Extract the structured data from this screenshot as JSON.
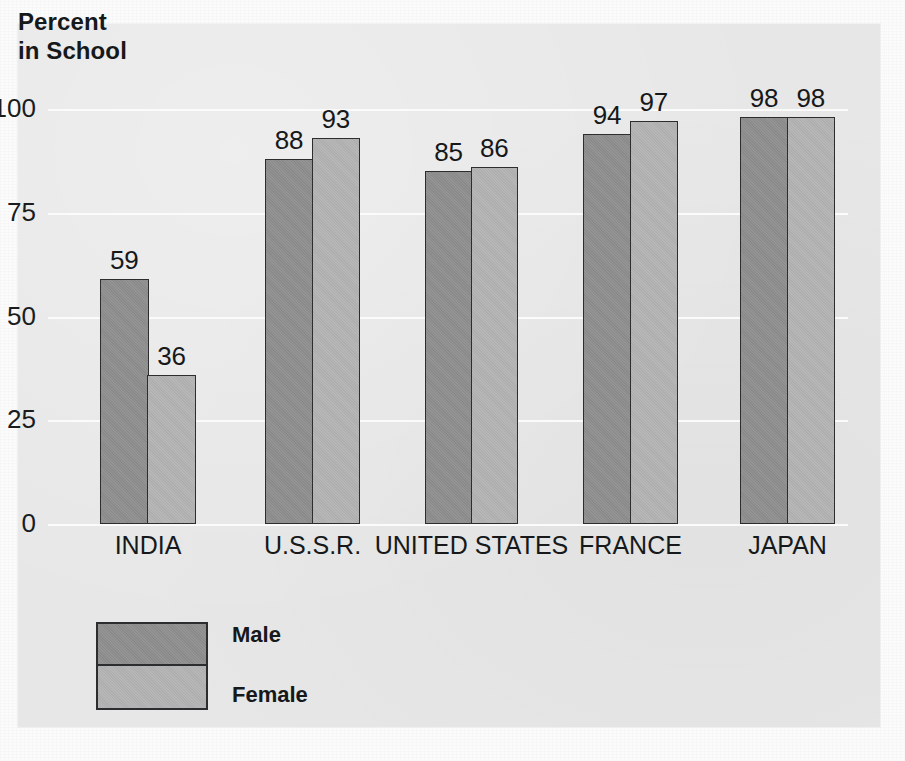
{
  "figure": {
    "title_line1": "Percent",
    "title_line2": "in School",
    "background_color": "#e6e7e6",
    "gridline_color": "#fafbfa"
  },
  "legend": {
    "position": "bottom-left",
    "entries": [
      {
        "label": "Male",
        "color": "#8d8e8d"
      },
      {
        "label": "Female",
        "color": "#b2b3b2"
      }
    ]
  },
  "chart_data": {
    "type": "bar",
    "title": "Percent in School",
    "xlabel": "",
    "ylabel": "Percent in School",
    "ylim": [
      0,
      100
    ],
    "yticks": [
      0,
      25,
      50,
      75,
      100
    ],
    "ytick_labels": [
      "0",
      "25",
      "50",
      "75",
      "100"
    ],
    "grid": true,
    "legend_position": "bottom-left",
    "categories": [
      "INDIA",
      "U.S.S.R.",
      "UNITED STATES",
      "FRANCE",
      "JAPAN"
    ],
    "series": [
      {
        "name": "Male",
        "color": "#8d8e8d",
        "values": [
          59,
          88,
          85,
          94,
          98
        ]
      },
      {
        "name": "Female",
        "color": "#b2b3b2",
        "values": [
          36,
          93,
          86,
          97,
          98
        ]
      }
    ],
    "value_labels": {
      "INDIA": {
        "Male": "59",
        "Female": "36"
      },
      "U.S.S.R.": {
        "Male": "88",
        "Female": "93"
      },
      "UNITED STATES": {
        "Male": "85",
        "Female": "86"
      },
      "FRANCE": {
        "Male": "94",
        "Female": "97"
      },
      "JAPAN": {
        "Male": "98",
        "Female": "98"
      }
    }
  }
}
